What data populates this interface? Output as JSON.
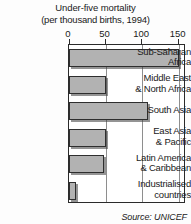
{
  "chart_data": {
    "type": "bar",
    "orientation": "horizontal",
    "title": "Under-five mortality",
    "subtitle": "(per thousand births, 1994)",
    "xlabel": "",
    "ylabel": "",
    "xlim": [
      0,
      160
    ],
    "grid": true,
    "legend": null,
    "tick_values": [
      0,
      50,
      100,
      150
    ],
    "tick_labels": [
      "0",
      "50",
      "100",
      "150"
    ],
    "categories": [
      "Sub-Saharan Africa",
      "Middle East & North Africa",
      "South Asia",
      "East Asia & Pacific",
      "Latin America & Caribbean",
      "Industrialised countries"
    ],
    "category_label_lines": [
      [
        "Sub-Saharan",
        "Africa"
      ],
      [
        "Middle East",
        "& North Africa"
      ],
      [
        "South Asia"
      ],
      [
        "East Asia",
        "& Pacific"
      ],
      [
        "Latin America",
        "& Caribbean"
      ],
      [
        "Industrialised",
        "countries"
      ]
    ],
    "values": [
      150,
      50,
      108,
      50,
      48,
      10
    ],
    "bar_color": "#b2b2b2",
    "bar_edge_color": "#2e2e2e",
    "source": "Source:  UNICEF"
  }
}
